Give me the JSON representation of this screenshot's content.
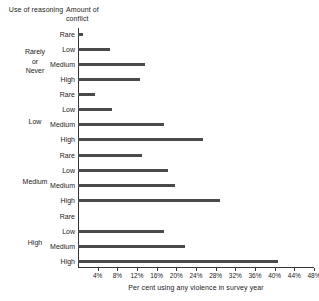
{
  "headers": {
    "reasoning": "Use of reasoning",
    "conflict": "Amount of conflict"
  },
  "axis": {
    "caption": "Per cent using any violence in survey year",
    "ticks": [
      "4%",
      "8%",
      "12%",
      "16%",
      "20%",
      "24%",
      "28%",
      "32%",
      "36%",
      "40%",
      "44%",
      "48%"
    ]
  },
  "groups": [
    {
      "name": "Rarely\nor\nNever",
      "line1": "Rarely",
      "line2": "or",
      "line3": "Never"
    },
    {
      "name": "Low",
      "line1": "Low",
      "line2": "",
      "line3": ""
    },
    {
      "name": "Medium",
      "line1": "Medium",
      "line2": "",
      "line3": ""
    },
    {
      "name": "High",
      "line1": "High",
      "line2": "",
      "line3": ""
    }
  ],
  "bar_labels": [
    "Rare",
    "Low",
    "Medium",
    "High"
  ],
  "colors": {
    "bar": "#4a4a4a",
    "axis": "#333333",
    "text": "#222222",
    "background": "#ffffff"
  },
  "chart_data": {
    "type": "bar",
    "title": "",
    "orientation": "horizontal",
    "xlabel": "Per cent using any violence in survey year",
    "ylabel": "",
    "xlim": [
      0,
      48
    ],
    "xtick_step": 4,
    "grid": false,
    "legend": "none",
    "group_axis_label": "Use of reasoning",
    "category_axis_label": "Amount of conflict",
    "groups": [
      "Rarely or Never",
      "Low",
      "Medium",
      "High"
    ],
    "categories": [
      "Rare",
      "Low",
      "Medium",
      "High"
    ],
    "series": [
      {
        "name": "Rarely or Never",
        "values": [
          1.0,
          6.5,
          13.7,
          12.6
        ]
      },
      {
        "name": "Low",
        "values": [
          3.5,
          7.0,
          17.5,
          25.5
        ]
      },
      {
        "name": "Medium",
        "values": [
          13.0,
          18.3,
          19.8,
          28.8
        ]
      },
      {
        "name": "High",
        "values": [
          0.0,
          17.5,
          21.8,
          40.6
        ]
      }
    ],
    "units": "per cent"
  }
}
